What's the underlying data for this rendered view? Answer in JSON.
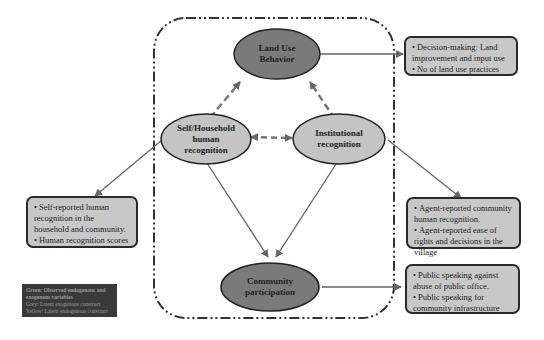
{
  "diagram": {
    "nodes": {
      "land_use": {
        "label": "Land Use Behavior",
        "line1": "Land Use",
        "line2": "Behavior",
        "fill": "#7a7a7a"
      },
      "self_household": {
        "label": "Self/Household human recognition",
        "line1": "Self/Household",
        "line2": "human",
        "line3": "recognition",
        "fill": "#c4c4c4"
      },
      "institutional": {
        "label": "Institutional recognition",
        "line1": "Institutional",
        "line2": "recognition",
        "fill": "#c4c4c4"
      },
      "community": {
        "label": "Community participation",
        "line1": "Community",
        "line2": "participation",
        "fill": "#7a7a7a"
      }
    },
    "boxes": {
      "land_use_indicators": [
        "Decision-making: Land improvement and input use",
        "No of land use practices"
      ],
      "self_indicators": [
        "Self-reported human recognition in the household and community.",
        "Human recognition scores"
      ],
      "institutional_indicators": [
        "Agent-reported community human recognition.",
        "Agent-reported ease of rights and decisions in the village"
      ],
      "community_indicators": [
        "Public speaking against abuse of public office.",
        "Public speaking for community infrastructure"
      ]
    },
    "legend": {
      "line1": "Green: Observed endogenous and",
      "line2": "exogenous variables",
      "line3": "Grey: Latent exogenous construct",
      "line4": "Yellow: Latent endogenous construct"
    },
    "edges": [
      {
        "from": "self_household",
        "to": "land_use",
        "style": "dashed"
      },
      {
        "from": "institutional",
        "to": "land_use",
        "style": "dashed"
      },
      {
        "from": "self_household",
        "to": "institutional",
        "style": "dashed-bidirectional"
      },
      {
        "from": "self_household",
        "to": "community",
        "style": "solid"
      },
      {
        "from": "institutional",
        "to": "community",
        "style": "solid"
      },
      {
        "from": "land_use",
        "to": "land_use_indicators",
        "style": "solid"
      },
      {
        "from": "self_household",
        "to": "self_indicators",
        "style": "solid"
      },
      {
        "from": "institutional",
        "to": "institutional_indicators",
        "style": "solid"
      },
      {
        "from": "community",
        "to": "community_indicators",
        "style": "solid"
      }
    ]
  }
}
